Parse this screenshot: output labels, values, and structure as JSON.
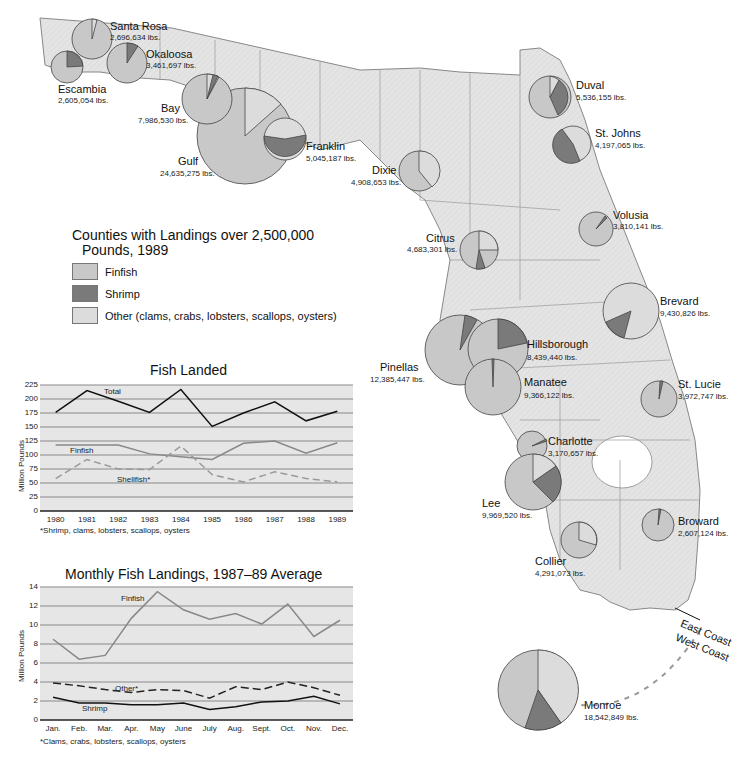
{
  "legend": {
    "title_line1": "Counties with Landings over 2,500,000",
    "title_line2": "Pounds, 1989",
    "items": [
      {
        "label": "Finfish",
        "color": "#c8c8c8"
      },
      {
        "label": "Shrimp",
        "color": "#7a7a7a"
      },
      {
        "label": "Other (clams, crabs, lobsters, scallops, oysters)",
        "color": "#dcdcdc"
      }
    ]
  },
  "counties": [
    {
      "name": "Santa Rosa",
      "lbs": "2,696,634 lbs."
    },
    {
      "name": "Okaloosa",
      "lbs": "3,461,697 lbs."
    },
    {
      "name": "Escambia",
      "lbs": "2,605,054 lbs."
    },
    {
      "name": "Bay",
      "lbs": "7,986,530 lbs."
    },
    {
      "name": "Franklin",
      "lbs": "5,045,187 lbs."
    },
    {
      "name": "Gulf",
      "lbs": "24,635,275 lbs."
    },
    {
      "name": "Dixie",
      "lbs": "4,908,653 lbs."
    },
    {
      "name": "Duval",
      "lbs": "5,536,155 lbs."
    },
    {
      "name": "St. Johns",
      "lbs": "4,197,065 lbs."
    },
    {
      "name": "Volusia",
      "lbs": "3,810,141 lbs."
    },
    {
      "name": "Citrus",
      "lbs": "4,683,301 lbs."
    },
    {
      "name": "Brevard",
      "lbs": "9,430,826 lbs."
    },
    {
      "name": "Hillsborough",
      "lbs": "8,439,440 lbs."
    },
    {
      "name": "Pinellas",
      "lbs": "12,385,447 lbs."
    },
    {
      "name": "Manatee",
      "lbs": "9,366,122 lbs."
    },
    {
      "name": "St. Lucie",
      "lbs": "3,972,747 lbs."
    },
    {
      "name": "Charlotte",
      "lbs": "3,170,657 lbs."
    },
    {
      "name": "Lee",
      "lbs": "9,969,520 lbs."
    },
    {
      "name": "Broward",
      "lbs": "2,607,124 lbs."
    },
    {
      "name": "Collier",
      "lbs": "4,291,073 lbs."
    },
    {
      "name": "Monroe",
      "lbs": "18,542,849 lbs."
    }
  ],
  "coast_labels": {
    "east": "East Coast",
    "west": "West Coast"
  },
  "chart_data": [
    {
      "type": "line",
      "title": "Fish Landed",
      "xlabel": "",
      "ylabel": "Million Pounds",
      "ylim": [
        0,
        225
      ],
      "yticks": [
        0,
        25,
        50,
        75,
        100,
        125,
        150,
        175,
        200,
        225
      ],
      "categories": [
        "1980",
        "1981",
        "1982",
        "1983",
        "1984",
        "1985",
        "1986",
        "1987",
        "1988",
        "1989"
      ],
      "series": [
        {
          "name": "Total",
          "values": [
            176,
            215,
            196,
            176,
            217,
            151,
            175,
            195,
            161,
            178
          ],
          "style": "solid-black"
        },
        {
          "name": "Finfish",
          "values": [
            118,
            118,
            118,
            102,
            97,
            92,
            121,
            125,
            103,
            122
          ],
          "style": "solid-gray"
        },
        {
          "name": "Shellfish*",
          "values": [
            58,
            92,
            75,
            74,
            116,
            65,
            52,
            70,
            58,
            52
          ],
          "style": "dashed-gray"
        }
      ],
      "footnote": "*Shrimp, clams, lobsters, scallops, oysters",
      "grid": true
    },
    {
      "type": "line",
      "title": "Monthly Fish Landings, 1987–89 Average",
      "xlabel": "",
      "ylabel": "Million Pounds",
      "ylim": [
        0,
        14
      ],
      "yticks": [
        0,
        2,
        4,
        6,
        8,
        10,
        12,
        14
      ],
      "categories": [
        "Jan.",
        "Feb.",
        "Mar.",
        "Apr.",
        "May",
        "June",
        "July",
        "Aug.",
        "Sept.",
        "Oct.",
        "Nov.",
        "Dec."
      ],
      "series": [
        {
          "name": "Finfish",
          "values": [
            8.5,
            6.4,
            6.8,
            10.7,
            13.5,
            11.6,
            10.6,
            11.2,
            10.1,
            12.2,
            8.8,
            10.5
          ],
          "style": "solid-gray"
        },
        {
          "name": "Other*",
          "values": [
            3.9,
            3.6,
            3.2,
            2.9,
            3.2,
            3.1,
            2.3,
            3.5,
            3.2,
            4.0,
            3.4,
            2.6
          ],
          "style": "dashed-black"
        },
        {
          "name": "Shrimp",
          "values": [
            2.4,
            1.8,
            1.8,
            1.6,
            1.6,
            1.8,
            1.1,
            1.4,
            1.9,
            2.0,
            2.5,
            1.7
          ],
          "style": "solid-black"
        }
      ],
      "footnote": "*Clams, crabs, lobsters, scallops, oysters",
      "grid": true
    }
  ]
}
